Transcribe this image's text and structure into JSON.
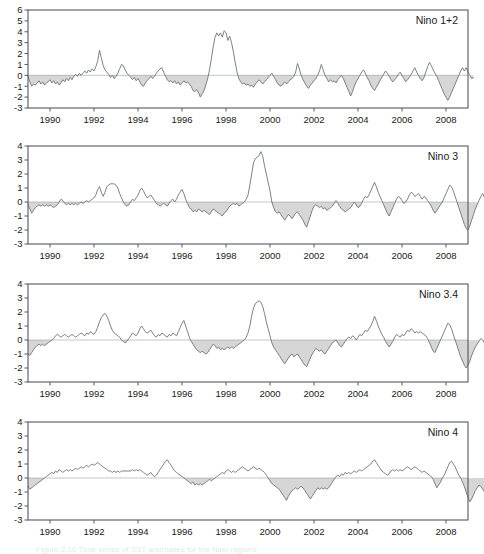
{
  "figure": {
    "title": "",
    "caption": "Figure 2.10  Time series of SST anomalies for the Nino regions",
    "xlabel": "",
    "line_color": "#6e747a",
    "fill_color": "#d6d6d6",
    "frame_color": "#555a5e"
  },
  "xaxis": {
    "min": 1989.0,
    "max": 2009.0,
    "ticks": [
      1990,
      1992,
      1994,
      1996,
      1998,
      2000,
      2002,
      2004,
      2006,
      2008
    ],
    "tick_labels": [
      "1990",
      "1992",
      "1994",
      "1996",
      "1998",
      "2000",
      "2002",
      "2004",
      "2006",
      "2008"
    ]
  },
  "chart_data": [
    {
      "type": "area",
      "name": "Nino 1+2",
      "label": "Nino  1+2",
      "title": "Nino  1+2",
      "xlabel": "",
      "ylabel": "",
      "xlim": [
        1989.0,
        2009.0
      ],
      "ylim": [
        -3,
        6
      ],
      "yticks": [
        -3,
        -2,
        -1,
        0,
        1,
        2,
        3,
        4,
        5,
        6
      ],
      "ytick_labels": [
        "-3",
        "-2",
        "-1",
        "0",
        "1",
        "2",
        "3",
        "4",
        "5",
        "6"
      ],
      "grid": false,
      "baseline": 0,
      "fill_below_baseline": true,
      "x_start": 1989.0,
      "x_step": 0.0833333,
      "values": [
        -0.1,
        -0.6,
        -1.0,
        -0.8,
        -0.9,
        -0.7,
        -0.5,
        -0.8,
        -0.6,
        -0.9,
        -0.7,
        -0.6,
        -0.4,
        -0.7,
        -0.5,
        -0.8,
        -0.6,
        -0.9,
        -0.7,
        -0.4,
        -0.6,
        -0.3,
        -0.5,
        -0.2,
        -0.4,
        -0.1,
        0.1,
        -0.1,
        0.2,
        0.0,
        0.2,
        0.4,
        0.2,
        0.5,
        0.3,
        0.6,
        0.4,
        0.8,
        1.3,
        2.3,
        1.6,
        0.9,
        0.5,
        0.3,
        0.1,
        -0.2,
        0.0,
        -0.3,
        -0.1,
        0.2,
        0.6,
        1.0,
        0.9,
        0.5,
        0.2,
        0.0,
        -0.2,
        -0.4,
        -0.2,
        -0.5,
        -0.3,
        -0.6,
        -0.9,
        -1.0,
        -0.7,
        -0.5,
        -0.3,
        -0.1,
        -0.3,
        -0.1,
        0.2,
        0.4,
        0.6,
        0.7,
        0.3,
        -0.1,
        -0.4,
        -0.6,
        -0.5,
        -0.7,
        -0.5,
        -0.8,
        -0.6,
        -0.9,
        -0.7,
        -0.5,
        -0.7,
        -0.6,
        -0.8,
        -1.0,
        -1.4,
        -1.5,
        -1.3,
        -1.6,
        -2.0,
        -1.7,
        -1.4,
        -0.9,
        -0.3,
        0.5,
        1.5,
        2.6,
        3.5,
        3.9,
        3.6,
        3.9,
        3.5,
        4.1,
        3.9,
        3.2,
        3.6,
        3.0,
        2.2,
        1.2,
        0.3,
        -0.3,
        -0.6,
        -0.8,
        -0.7,
        -0.9,
        -0.8,
        -1.0,
        -0.9,
        -1.1,
        -0.8,
        -0.6,
        -0.4,
        -0.6,
        -0.8,
        -0.6,
        -0.4,
        -0.2,
        0.0,
        0.2,
        -0.1,
        -0.4,
        -0.7,
        -0.9,
        -1.0,
        -0.8,
        -0.6,
        -0.8,
        -0.6,
        -0.4,
        -0.3,
        -0.1,
        0.3,
        1.1,
        0.6,
        0.0,
        -0.4,
        -0.7,
        -1.0,
        -1.2,
        -0.9,
        -0.7,
        -0.5,
        -0.3,
        0.0,
        0.4,
        1.0,
        0.5,
        0.0,
        -0.3,
        -0.6,
        -0.4,
        -0.6,
        -0.5,
        -0.7,
        -0.4,
        -0.2,
        0.0,
        -0.3,
        -0.7,
        -1.1,
        -1.5,
        -1.9,
        -1.5,
        -1.0,
        -0.6,
        -0.3,
        0.0,
        0.3,
        0.5,
        0.2,
        -0.2,
        -0.5,
        -0.9,
        -1.2,
        -1.4,
        -1.1,
        -0.8,
        -0.5,
        -0.2,
        0.1,
        0.4,
        0.2,
        -0.1,
        -0.4,
        -0.6,
        -0.4,
        -0.2,
        0.1,
        0.3,
        0.0,
        -0.3,
        -0.6,
        -0.4,
        -0.2,
        0.1,
        0.4,
        0.7,
        0.3,
        0.0,
        -0.3,
        -0.5,
        -0.2,
        0.3,
        0.8,
        1.2,
        0.9,
        0.5,
        0.2,
        -0.1,
        -0.5,
        -0.9,
        -1.3,
        -1.7,
        -2.0,
        -2.3,
        -2.0,
        -1.6,
        -1.2,
        -0.8,
        -0.4,
        0.0,
        0.4,
        0.7,
        0.4,
        0.7,
        0.3,
        0.0,
        -0.3,
        -0.2
      ]
    },
    {
      "type": "area",
      "name": "Nino 3",
      "label": "Nino  3",
      "title": "Nino  3",
      "xlabel": "",
      "ylabel": "",
      "xlim": [
        1989.0,
        2009.0
      ],
      "ylim": [
        -3,
        4
      ],
      "yticks": [
        -3,
        -2,
        -1,
        0,
        1,
        2,
        3,
        4
      ],
      "ytick_labels": [
        "-3",
        "-2",
        "-1",
        "0",
        "1",
        "2",
        "3",
        "4"
      ],
      "grid": false,
      "baseline": 0,
      "fill_below_baseline": true,
      "x_start": 1989.0,
      "x_step": 0.0833333,
      "values": [
        -0.2,
        -0.5,
        -0.8,
        -0.6,
        -0.4,
        -0.3,
        -0.2,
        -0.3,
        -0.2,
        -0.3,
        -0.2,
        -0.3,
        -0.2,
        -0.3,
        -0.4,
        -0.3,
        -0.2,
        0.0,
        0.2,
        0.1,
        -0.1,
        -0.2,
        -0.1,
        -0.2,
        -0.1,
        -0.2,
        -0.1,
        -0.2,
        -0.1,
        0.0,
        -0.1,
        0.0,
        0.1,
        0.0,
        0.1,
        0.2,
        0.3,
        0.5,
        0.9,
        1.1,
        0.7,
        0.4,
        0.7,
        1.1,
        1.2,
        1.3,
        1.3,
        1.3,
        1.2,
        1.0,
        0.6,
        0.3,
        0.0,
        -0.2,
        -0.3,
        -0.2,
        0.0,
        0.2,
        0.1,
        0.3,
        0.5,
        0.8,
        1.0,
        0.8,
        0.5,
        0.3,
        0.4,
        0.5,
        0.3,
        0.1,
        -0.1,
        -0.2,
        -0.3,
        -0.2,
        -0.1,
        -0.2,
        -0.3,
        -0.1,
        0.1,
        0.2,
        0.0,
        0.2,
        0.5,
        0.7,
        0.9,
        0.6,
        0.2,
        -0.1,
        -0.4,
        -0.5,
        -0.7,
        -0.6,
        -0.7,
        -0.5,
        -0.6,
        -0.7,
        -0.6,
        -0.7,
        -0.8,
        -0.9,
        -0.7,
        -0.5,
        -0.6,
        -0.7,
        -0.8,
        -0.9,
        -1.0,
        -0.8,
        -0.7,
        -0.5,
        -0.3,
        -0.2,
        -0.1,
        -0.2,
        -0.1,
        -0.3,
        -0.2,
        -0.1,
        0.0,
        0.2,
        0.5,
        1.2,
        2.0,
        2.8,
        3.1,
        3.2,
        3.3,
        3.6,
        3.3,
        2.6,
        2.0,
        1.4,
        0.8,
        0.0,
        -0.4,
        -0.7,
        -0.8,
        -0.7,
        -0.9,
        -1.1,
        -1.3,
        -1.1,
        -0.9,
        -1.0,
        -1.2,
        -1.0,
        -0.8,
        -0.7,
        -0.9,
        -1.1,
        -1.3,
        -1.6,
        -1.8,
        -1.4,
        -1.0,
        -0.6,
        -0.3,
        -0.2,
        -0.3,
        -0.4,
        -0.3,
        -0.5,
        -0.4,
        -0.6,
        -0.5,
        -0.4,
        -0.3,
        -0.1,
        0.1,
        -0.1,
        -0.3,
        -0.5,
        -0.6,
        -0.7,
        -0.6,
        -0.5,
        -0.4,
        -0.2,
        0.0,
        -0.2,
        -0.4,
        -0.3,
        -0.1,
        0.2,
        0.4,
        0.3,
        0.5,
        0.8,
        1.1,
        1.4,
        1.1,
        0.7,
        0.4,
        0.1,
        -0.2,
        -0.5,
        -0.8,
        -1.0,
        -0.7,
        -0.4,
        -0.1,
        0.2,
        0.4,
        0.3,
        0.1,
        -0.1,
        0.0,
        0.2,
        0.5,
        0.7,
        0.6,
        0.4,
        0.5,
        0.6,
        0.4,
        0.2,
        0.4,
        0.3,
        0.1,
        -0.1,
        -0.3,
        -0.6,
        -0.8,
        -0.6,
        -0.4,
        -0.2,
        0.0,
        0.3,
        0.6,
        0.9,
        1.2,
        1.1,
        0.8,
        0.4,
        0.0,
        -0.4,
        -0.8,
        -1.2,
        -1.6,
        -1.9,
        -2.0,
        -1.7,
        -1.3,
        -0.9,
        -0.5,
        -0.2,
        0.1,
        0.4,
        0.6,
        0.3,
        -0.1,
        -0.4,
        -0.6,
        -0.5,
        -0.6,
        -0.5
      ]
    },
    {
      "type": "area",
      "name": "Nino 3.4",
      "label": "Nino  3.4",
      "title": "Nino  3.4",
      "xlabel": "",
      "ylabel": "",
      "xlim": [
        1989.0,
        2009.0
      ],
      "ylim": [
        -3,
        4
      ],
      "yticks": [
        -3,
        -2,
        -1,
        0,
        1,
        2,
        3,
        4
      ],
      "ytick_labels": [
        "-3",
        "-2",
        "-1",
        "0",
        "1",
        "2",
        "3",
        "4"
      ],
      "grid": false,
      "baseline": 0,
      "fill_below_baseline": true,
      "x_start": 1989.0,
      "x_step": 0.0833333,
      "values": [
        -1.0,
        -1.1,
        -0.9,
        -0.7,
        -0.5,
        -0.4,
        -0.3,
        -0.4,
        -0.3,
        -0.4,
        -0.3,
        -0.2,
        -0.1,
        0.0,
        0.1,
        0.3,
        0.4,
        0.3,
        0.2,
        0.3,
        0.4,
        0.3,
        0.2,
        0.3,
        0.4,
        0.3,
        0.2,
        0.3,
        0.4,
        0.5,
        0.4,
        0.3,
        0.5,
        0.4,
        0.6,
        0.5,
        0.4,
        0.6,
        0.9,
        1.3,
        1.6,
        1.8,
        1.9,
        1.7,
        1.4,
        1.0,
        0.7,
        0.5,
        0.4,
        0.3,
        0.2,
        0.0,
        -0.1,
        -0.2,
        -0.1,
        0.1,
        0.3,
        0.5,
        0.4,
        0.3,
        0.5,
        0.8,
        1.0,
        0.8,
        0.6,
        0.5,
        0.6,
        0.7,
        0.5,
        0.3,
        0.2,
        0.4,
        0.3,
        0.5,
        0.4,
        0.3,
        0.2,
        0.4,
        0.3,
        0.5,
        0.4,
        0.3,
        0.6,
        0.9,
        1.2,
        1.4,
        1.0,
        0.6,
        0.2,
        -0.1,
        -0.3,
        -0.5,
        -0.7,
        -0.8,
        -0.9,
        -0.8,
        -0.9,
        -1.0,
        -0.9,
        -0.7,
        -0.5,
        -0.3,
        -0.4,
        -0.6,
        -0.5,
        -0.7,
        -0.6,
        -0.7,
        -0.6,
        -0.5,
        -0.6,
        -0.5,
        -0.6,
        -0.5,
        -0.4,
        -0.3,
        -0.2,
        -0.1,
        0.0,
        0.2,
        0.5,
        1.0,
        1.7,
        2.3,
        2.6,
        2.7,
        2.8,
        2.7,
        2.4,
        1.9,
        1.3,
        0.8,
        0.3,
        -0.2,
        -0.5,
        -0.7,
        -0.9,
        -1.1,
        -1.3,
        -1.5,
        -1.7,
        -1.5,
        -1.3,
        -1.1,
        -1.0,
        -1.2,
        -1.1,
        -1.0,
        -1.2,
        -1.4,
        -1.6,
        -1.8,
        -1.9,
        -1.6,
        -1.3,
        -1.0,
        -0.8,
        -0.6,
        -0.7,
        -0.8,
        -0.7,
        -0.9,
        -1.0,
        -0.8,
        -0.6,
        -0.4,
        -0.2,
        -0.1,
        0.0,
        -0.2,
        -0.4,
        -0.5,
        -0.3,
        -0.1,
        0.1,
        0.2,
        0.1,
        0.3,
        0.2,
        0.0,
        0.2,
        0.4,
        0.3,
        0.5,
        0.7,
        0.6,
        0.8,
        1.0,
        1.3,
        1.7,
        1.4,
        1.0,
        0.7,
        0.4,
        0.2,
        -0.1,
        -0.3,
        -0.5,
        -0.3,
        -0.1,
        0.2,
        0.4,
        0.3,
        0.2,
        0.4,
        0.3,
        0.5,
        0.7,
        0.6,
        0.8,
        0.7,
        0.5,
        0.6,
        0.5,
        0.6,
        0.5,
        0.4,
        0.3,
        0.1,
        -0.2,
        -0.5,
        -0.8,
        -0.9,
        -0.6,
        -0.3,
        0.0,
        0.3,
        0.6,
        0.9,
        1.2,
        1.1,
        0.8,
        0.4,
        0.0,
        -0.4,
        -0.8,
        -1.2,
        -1.5,
        -1.8,
        -2.0,
        -1.8,
        -1.5,
        -1.1,
        -0.8,
        -0.5,
        -0.3,
        -0.1,
        0.1,
        0.0,
        -0.2,
        -0.5,
        -0.8,
        -1.0,
        -0.8,
        -1.0,
        -0.9
      ]
    },
    {
      "type": "area",
      "name": "Nino 4",
      "label": "Nino  4",
      "title": "Nino  4",
      "xlabel": "",
      "ylabel": "",
      "xlim": [
        1989.0,
        2009.0
      ],
      "ylim": [
        -3,
        4
      ],
      "yticks": [
        -3,
        -2,
        -1,
        0,
        1,
        2,
        3,
        4
      ],
      "ytick_labels": [
        "-3",
        "-2",
        "-1",
        "0",
        "1",
        "2",
        "3",
        "4"
      ],
      "grid": false,
      "baseline": 0,
      "fill_below_baseline": true,
      "x_start": 1989.0,
      "x_step": 0.0833333,
      "values": [
        -0.6,
        -0.8,
        -0.7,
        -0.6,
        -0.5,
        -0.4,
        -0.3,
        -0.2,
        -0.1,
        0.0,
        0.1,
        0.2,
        0.3,
        0.4,
        0.3,
        0.5,
        0.4,
        0.6,
        0.5,
        0.4,
        0.5,
        0.6,
        0.5,
        0.6,
        0.5,
        0.6,
        0.7,
        0.6,
        0.7,
        0.8,
        0.7,
        0.8,
        0.9,
        0.8,
        0.9,
        1.0,
        0.9,
        1.0,
        1.1,
        1.0,
        0.9,
        0.8,
        0.7,
        0.6,
        0.5,
        0.5,
        0.4,
        0.5,
        0.4,
        0.5,
        0.4,
        0.5,
        0.5,
        0.5,
        0.5,
        0.5,
        0.5,
        0.6,
        0.5,
        0.6,
        0.5,
        0.6,
        0.5,
        0.4,
        0.3,
        0.2,
        0.3,
        0.4,
        0.2,
        0.1,
        0.2,
        0.4,
        0.6,
        0.8,
        1.0,
        1.2,
        1.3,
        1.1,
        0.9,
        0.7,
        0.5,
        0.4,
        0.3,
        0.2,
        0.1,
        0.0,
        -0.1,
        -0.2,
        -0.3,
        -0.4,
        -0.3,
        -0.5,
        -0.4,
        -0.5,
        -0.4,
        -0.5,
        -0.4,
        -0.3,
        -0.2,
        -0.1,
        -0.2,
        -0.1,
        0.0,
        0.1,
        0.2,
        0.3,
        0.4,
        0.3,
        0.5,
        0.6,
        0.5,
        0.4,
        0.5,
        0.4,
        0.5,
        0.6,
        0.7,
        0.8,
        0.7,
        0.6,
        0.5,
        0.6,
        0.7,
        0.8,
        0.7,
        0.6,
        0.7,
        0.6,
        0.5,
        0.4,
        0.2,
        0.0,
        -0.2,
        -0.4,
        -0.5,
        -0.6,
        -0.7,
        -0.8,
        -1.0,
        -1.2,
        -1.4,
        -1.6,
        -1.3,
        -1.1,
        -0.9,
        -0.8,
        -0.7,
        -0.8,
        -0.7,
        -0.6,
        -0.7,
        -0.9,
        -1.1,
        -1.3,
        -1.5,
        -1.3,
        -1.1,
        -0.9,
        -0.7,
        -0.8,
        -0.7,
        -0.8,
        -0.7,
        -0.8,
        -0.7,
        -0.5,
        -0.3,
        -0.1,
        0.1,
        0.2,
        0.1,
        0.3,
        0.2,
        0.4,
        0.3,
        0.4,
        0.3,
        0.4,
        0.5,
        0.4,
        0.5,
        0.6,
        0.5,
        0.6,
        0.7,
        0.8,
        0.9,
        1.0,
        1.2,
        1.3,
        1.1,
        0.9,
        0.7,
        0.5,
        0.4,
        0.3,
        0.2,
        0.3,
        0.5,
        0.6,
        0.5,
        0.6,
        0.5,
        0.6,
        0.5,
        0.6,
        0.7,
        0.8,
        0.7,
        0.6,
        0.7,
        0.8,
        0.7,
        0.6,
        0.5,
        0.4,
        0.5,
        0.4,
        0.3,
        0.2,
        0.1,
        -0.1,
        -0.4,
        -0.7,
        -0.5,
        -0.3,
        0.0,
        0.2,
        0.5,
        0.8,
        1.1,
        1.2,
        1.0,
        0.8,
        0.5,
        0.2,
        0.0,
        -0.3,
        -0.6,
        -1.0,
        -1.4,
        -1.7,
        -1.5,
        -1.2,
        -0.9,
        -0.7,
        -0.5,
        -0.6,
        -0.8,
        -1.0,
        -1.2,
        -1.0,
        -0.8,
        -0.6,
        -0.7,
        -0.6
      ]
    }
  ]
}
